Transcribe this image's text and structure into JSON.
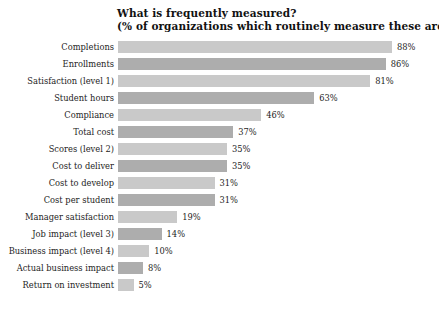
{
  "chart": {
    "title_line1": "What is frequently measured?",
    "title_line2": "(% of organizations which routinely measure these areas)"
  },
  "chart_data": {
    "type": "bar",
    "orientation": "horizontal",
    "title": "What is frequently measured? (% of organizations which routinely measure these areas)",
    "subtitle": "(% of organizations which routinely measure these areas)",
    "xlabel": "",
    "ylabel": "",
    "xlim": [
      0,
      88
    ],
    "grid": false,
    "legend": false,
    "value_suffix": "%",
    "bar_colors": [
      "#c9c9c9",
      "#adadad"
    ],
    "categories": [
      "Completions",
      "Enrollments",
      "Satisfaction (level 1)",
      "Student hours",
      "Compliance",
      "Total cost",
      "Scores (level 2)",
      "Cost to deliver",
      "Cost to develop",
      "Cost per student",
      "Manager satisfaction",
      "Job impact (level 3)",
      "Business impact (level 4)",
      "Actual business impact",
      "Return on investment"
    ],
    "values": [
      88,
      86,
      81,
      63,
      46,
      37,
      35,
      35,
      31,
      31,
      19,
      14,
      10,
      8,
      5
    ],
    "value_labels": [
      "88%",
      "86%",
      "81%",
      "63%",
      "46%",
      "37%",
      "35%",
      "35%",
      "31%",
      "31%",
      "19%",
      "14%",
      "10%",
      "8%",
      "5%"
    ]
  }
}
